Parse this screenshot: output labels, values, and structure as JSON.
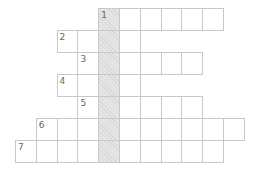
{
  "crossword": {
    "origin": {
      "x": 15,
      "y": 8
    },
    "cell_size": {
      "w": 20.8,
      "h": 22
    },
    "key_column": 4,
    "key_color": "#e6e6e6",
    "border_color": "#c8c8c8",
    "rows": [
      {
        "number": "1",
        "start_col": 4,
        "length": 6
      },
      {
        "number": "2",
        "start_col": 2,
        "length": 4
      },
      {
        "number": "3",
        "start_col": 3,
        "length": 6
      },
      {
        "number": "4",
        "start_col": 2,
        "length": 4
      },
      {
        "number": "5",
        "start_col": 3,
        "length": 6
      },
      {
        "number": "6",
        "start_col": 1,
        "length": 10
      },
      {
        "number": "7",
        "start_col": 0,
        "length": 10
      }
    ]
  }
}
